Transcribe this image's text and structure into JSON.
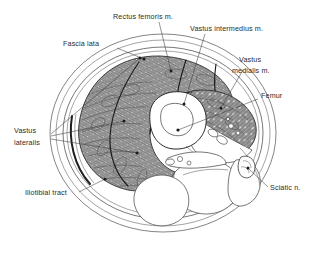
{
  "figure": {
    "background_color": "#ffffff",
    "line_color": "#333333",
    "label_color": "#2b2b2b",
    "muscle_fill": "#9a9a9a",
    "bone_fill": "#ffffff"
  },
  "labels": {
    "rectus_femoris": "Rectus femoris m.",
    "vastus_intermedius": "Vastus intermedius m.",
    "vastus_medialis_line1": "Vastus",
    "vastus_medialis_line2": "medialis m.",
    "fascia_lata": "Fascia lata",
    "femur": "Femur",
    "vastus_lateralis_line1": "Vastus",
    "vastus_lateralis_line2": "lateralis",
    "iliotibial_tract": "Iliotibial tract",
    "sciatic_nerve": "Sciatic n."
  },
  "structures": [
    {
      "name": "rectus-femoris",
      "label": "Rectus femoris m.",
      "region": "anterior"
    },
    {
      "name": "vastus-intermedius",
      "label": "Vastus intermedius m.",
      "region": "anterior-deep"
    },
    {
      "name": "vastus-medialis",
      "label": "Vastus medialis m.",
      "region": "medial"
    },
    {
      "name": "vastus-lateralis",
      "label": "Vastus lateralis",
      "region": "lateral"
    },
    {
      "name": "fascia-lata",
      "label": "Fascia lata",
      "region": "circumferential"
    },
    {
      "name": "iliotibial-tract",
      "label": "Iliotibial tract",
      "region": "lateral-superficial"
    },
    {
      "name": "femur",
      "label": "Femur",
      "region": "central"
    },
    {
      "name": "sciatic-nerve",
      "label": "Sciatic n.",
      "region": "posterior"
    }
  ]
}
